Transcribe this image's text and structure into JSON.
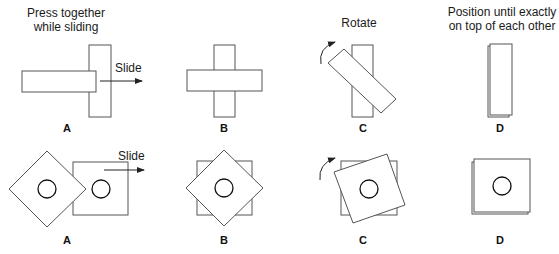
{
  "figure": {
    "captions": {
      "a_line1": "Press together",
      "a_line2": "while sliding",
      "c": "Rotate",
      "d_line1": "Position until exactly",
      "d_line2": "on top of each other"
    },
    "action_labels": {
      "slide_top": "Slide",
      "slide_bottom": "Slide"
    },
    "rows": [
      {
        "name": "bar-row",
        "panels": [
          {
            "label": "A",
            "step": "slide"
          },
          {
            "label": "B",
            "step": "crossed"
          },
          {
            "label": "C",
            "step": "rotate"
          },
          {
            "label": "D",
            "step": "aligned"
          }
        ]
      },
      {
        "name": "square-row",
        "panels": [
          {
            "label": "A",
            "step": "slide"
          },
          {
            "label": "B",
            "step": "overlapped"
          },
          {
            "label": "C",
            "step": "rotate"
          },
          {
            "label": "D",
            "step": "aligned"
          }
        ]
      }
    ]
  }
}
